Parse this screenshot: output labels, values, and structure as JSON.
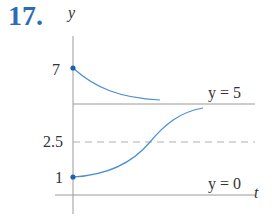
{
  "problem_number": "17.",
  "axes": {
    "x_label": "t",
    "y_label": "y"
  },
  "y_ticks": [
    "7",
    "2.5",
    "1"
  ],
  "equilibria": [
    {
      "label": "y = 5",
      "value": 5,
      "style": "solid"
    },
    {
      "label": "y = 0",
      "value": 0,
      "style": "solid"
    }
  ],
  "reference_line": {
    "value": 2.5,
    "style": "dashed"
  },
  "curves": [
    {
      "name": "upper",
      "start": 7,
      "approaches": 5,
      "behavior": "decreasing"
    },
    {
      "name": "lower",
      "start": 1,
      "approaches": 5,
      "behavior": "increasing, inflection at y=2.5"
    }
  ],
  "colors": {
    "curve": "#4a8fd4",
    "point": "#1f5fb0",
    "axis": "#9a9a9a",
    "number": "#2a6db3"
  }
}
